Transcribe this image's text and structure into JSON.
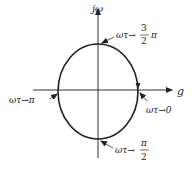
{
  "diagram": {
    "axes": {
      "vertical_label": "jω",
      "horizontal_label": "g"
    },
    "curve": {
      "shape": "ellipse",
      "direction": "clockwise",
      "stroke": "#222222"
    },
    "annotations": [
      {
        "id": "top",
        "prefix": "ωτ→",
        "frac_num": "3",
        "frac_den": "2",
        "suffix": "π"
      },
      {
        "id": "left",
        "text": "ωτ→π"
      },
      {
        "id": "right",
        "text": "ωτ→0"
      },
      {
        "id": "bottom",
        "prefix": "ωτ→",
        "frac_num": "π",
        "frac_den": "2"
      }
    ]
  }
}
